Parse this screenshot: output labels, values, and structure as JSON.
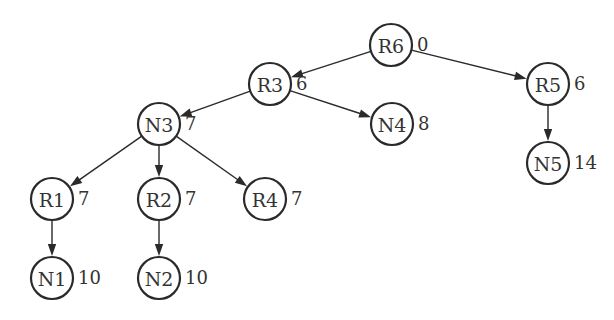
{
  "diagram": {
    "type": "tree",
    "nodes": [
      {
        "id": "R6",
        "label": "R6",
        "value": "0"
      },
      {
        "id": "R3",
        "label": "R3",
        "value": "6"
      },
      {
        "id": "R5",
        "label": "R5",
        "value": "6"
      },
      {
        "id": "N3",
        "label": "N3",
        "value": "7"
      },
      {
        "id": "N4",
        "label": "N4",
        "value": "8"
      },
      {
        "id": "N5",
        "label": "N5",
        "value": "14"
      },
      {
        "id": "R1",
        "label": "R1",
        "value": "7"
      },
      {
        "id": "R2",
        "label": "R2",
        "value": "7"
      },
      {
        "id": "R4",
        "label": "R4",
        "value": "7"
      },
      {
        "id": "N1",
        "label": "N1",
        "value": "10"
      },
      {
        "id": "N2",
        "label": "N2",
        "value": "10"
      }
    ],
    "edges": [
      {
        "from": "R6",
        "to": "R3"
      },
      {
        "from": "R6",
        "to": "R5"
      },
      {
        "from": "R3",
        "to": "N3"
      },
      {
        "from": "R3",
        "to": "N4"
      },
      {
        "from": "R5",
        "to": "N5"
      },
      {
        "from": "N3",
        "to": "R1"
      },
      {
        "from": "N3",
        "to": "R2"
      },
      {
        "from": "N3",
        "to": "R4"
      },
      {
        "from": "R1",
        "to": "N1"
      },
      {
        "from": "R2",
        "to": "N2"
      }
    ],
    "colors": {
      "stroke": "#2a2a2a",
      "text": "#333333",
      "background": "#ffffff"
    }
  }
}
